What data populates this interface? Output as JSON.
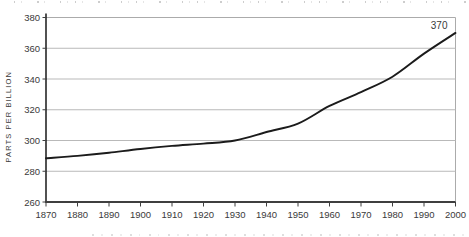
{
  "chart_data": {
    "type": "line",
    "title": "",
    "ylabel": "PARTS PER BILLION",
    "xlabel": "",
    "x": [
      1870,
      1880,
      1890,
      1900,
      1910,
      1920,
      1930,
      1940,
      1950,
      1960,
      1970,
      1980,
      1990,
      2000
    ],
    "x_tick_labels": [
      "1870",
      "1880",
      "1890",
      "1900",
      "1910",
      "1920",
      "1930",
      "1940",
      "1950",
      "1960",
      "1970",
      "1980",
      "1990",
      "2000"
    ],
    "series": [
      {
        "name": "atmospheric-concentration",
        "values": [
          288.5,
          290,
          292,
          294.5,
          296.5,
          298,
          300,
          305.5,
          311,
          322.5,
          331.5,
          341.5,
          356.5,
          370
        ]
      }
    ],
    "yticks": [
      260,
      280,
      300,
      320,
      340,
      360,
      380
    ],
    "ylim": [
      260,
      380
    ],
    "xlim": [
      1870,
      2000
    ],
    "end_point_label": "370",
    "grid": "horizontal",
    "legend_position": "none",
    "colors": {
      "line": "#1b1b1b",
      "grid": "#b9b9b9",
      "frame": "#ababab",
      "axis": "#3f3f3f",
      "text": "#3a3a3a",
      "background": "#ffffff"
    }
  },
  "clipped_text": {
    "top_row": "illegible caption fragments (line cut off by top edge)",
    "bottom_row": "illegible text fragments (line cut off by bottom edge)"
  }
}
